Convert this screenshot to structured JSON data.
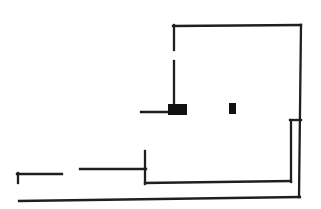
{
  "canvas": {
    "width": 321,
    "height": 209,
    "background": "#ffffff",
    "ink_color": "#1f1f1f",
    "fill_color": "#111111",
    "stroke_width": 2.3
  },
  "diagram": {
    "type": "line-sketch-floor-plan",
    "segments": [
      {
        "name": "top-wall",
        "x1": 173,
        "y1": 26,
        "x2": 301,
        "y2": 25
      },
      {
        "name": "right-outer-wall",
        "x1": 301,
        "y1": 25,
        "x2": 299,
        "y2": 197
      },
      {
        "name": "bottom-outer-wall",
        "x1": 300,
        "y1": 197,
        "x2": 19,
        "y2": 201
      },
      {
        "name": "left-wall-upper",
        "x1": 174,
        "y1": 25,
        "x2": 174,
        "y2": 50
      },
      {
        "name": "left-wall-lower",
        "x1": 174,
        "y1": 61,
        "x2": 174,
        "y2": 107
      },
      {
        "name": "hearth-stub-wall",
        "x1": 141,
        "y1": 112,
        "x2": 170,
        "y2": 112
      },
      {
        "name": "right-jog-wall",
        "x1": 290,
        "y1": 120,
        "x2": 301,
        "y2": 120
      },
      {
        "name": "right-inner-wall",
        "x1": 291,
        "y1": 120,
        "x2": 291,
        "y2": 182
      },
      {
        "name": "bottom-inner-wall",
        "x1": 291,
        "y1": 181,
        "x2": 145,
        "y2": 183
      },
      {
        "name": "mid-vertical-wall",
        "x1": 145,
        "y1": 151,
        "x2": 145,
        "y2": 184
      },
      {
        "name": "mid-horizontal-wall",
        "x1": 80,
        "y1": 169,
        "x2": 146,
        "y2": 169
      },
      {
        "name": "left-segment-wall",
        "x1": 17,
        "y1": 174,
        "x2": 62,
        "y2": 174
      },
      {
        "name": "left-segment-tick",
        "x1": 18,
        "y1": 173,
        "x2": 18,
        "y2": 183
      }
    ],
    "filled_marks": [
      {
        "name": "large-post-mark",
        "x": 168,
        "y": 104,
        "w": 19,
        "h": 11
      },
      {
        "name": "small-post-mark",
        "x": 229,
        "y": 103,
        "w": 7,
        "h": 11
      }
    ]
  }
}
